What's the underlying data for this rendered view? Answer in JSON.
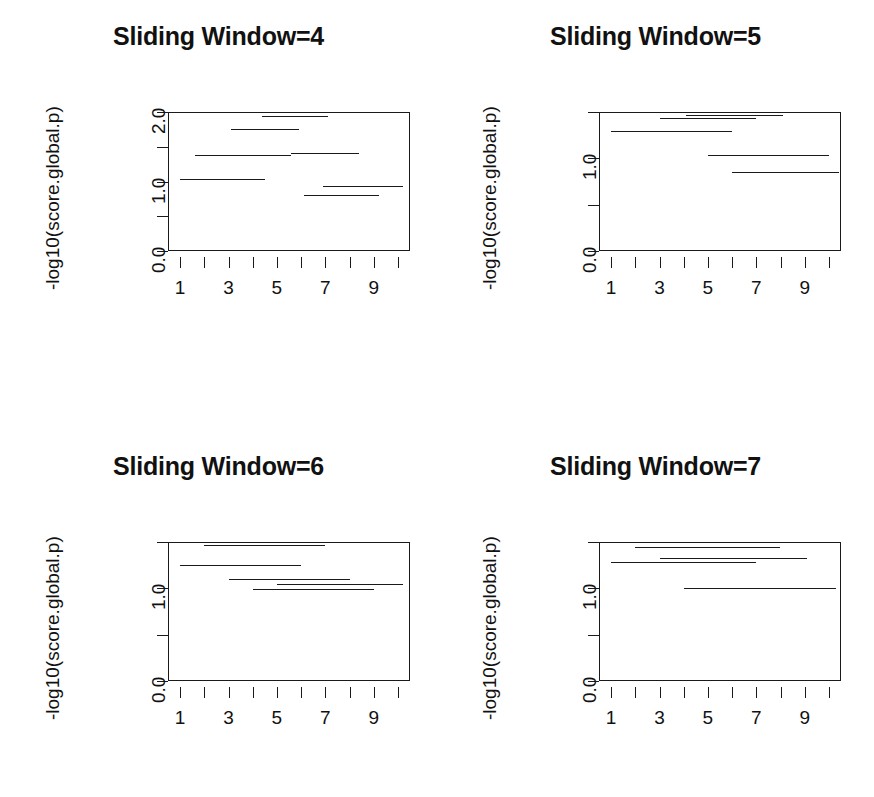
{
  "figure": {
    "layout": "2x2",
    "background": "#ffffff",
    "ink_color": "#1a1a1a"
  },
  "chart_data": [
    {
      "type": "line",
      "title": "Sliding Window=4",
      "xlabel": "",
      "ylabel": "-log10(score.global.p)",
      "xlim": [
        0.5,
        10.5
      ],
      "ylim": [
        0.0,
        2.0
      ],
      "grid": false,
      "legend": "none",
      "xticks": [
        1,
        2,
        3,
        4,
        5,
        6,
        7,
        8,
        9,
        10
      ],
      "xticklabels": [
        "1",
        "",
        "3",
        "",
        "5",
        "",
        "7",
        "",
        "9",
        ""
      ],
      "yticks": [
        0.0,
        0.5,
        1.0,
        1.5,
        2.0
      ],
      "yticklabels": [
        "0.0",
        "",
        "1.0",
        "",
        "2.0"
      ],
      "series_name": "segments",
      "segments": [
        {
          "x_start": 4.4,
          "x_end": 7.1,
          "y": 1.94
        },
        {
          "x_start": 3.1,
          "x_end": 5.9,
          "y": 1.76
        },
        {
          "x_start": 1.6,
          "x_end": 5.6,
          "y": 1.38
        },
        {
          "x_start": 5.6,
          "x_end": 8.4,
          "y": 1.41
        },
        {
          "x_start": 1.0,
          "x_end": 4.5,
          "y": 1.04
        },
        {
          "x_start": 6.9,
          "x_end": 10.2,
          "y": 0.93
        },
        {
          "x_start": 6.1,
          "x_end": 9.2,
          "y": 0.8
        }
      ]
    },
    {
      "type": "line",
      "title": "Sliding Window=5",
      "xlabel": "",
      "ylabel": "-log10(score.global.p)",
      "xlim": [
        0.5,
        10.5
      ],
      "ylim": [
        0.0,
        1.5
      ],
      "grid": false,
      "legend": "none",
      "xticks": [
        1,
        2,
        3,
        4,
        5,
        6,
        7,
        8,
        9,
        10
      ],
      "xticklabels": [
        "1",
        "",
        "3",
        "",
        "5",
        "",
        "7",
        "",
        "9",
        ""
      ],
      "yticks": [
        0.0,
        0.5,
        1.0,
        1.5
      ],
      "yticklabels": [
        "0.0",
        "",
        "1.0",
        ""
      ],
      "series_name": "segments",
      "segments": [
        {
          "x_start": 4.1,
          "x_end": 8.1,
          "y": 1.47
        },
        {
          "x_start": 3.0,
          "x_end": 7.0,
          "y": 1.43
        },
        {
          "x_start": 1.0,
          "x_end": 6.0,
          "y": 1.29
        },
        {
          "x_start": 5.0,
          "x_end": 10.0,
          "y": 1.04
        },
        {
          "x_start": 6.0,
          "x_end": 10.4,
          "y": 0.85
        }
      ]
    },
    {
      "type": "line",
      "title": "Sliding Window=6",
      "xlabel": "",
      "ylabel": "-log10(score.global.p)",
      "xlim": [
        0.5,
        10.5
      ],
      "ylim": [
        0.0,
        1.5
      ],
      "grid": false,
      "legend": "none",
      "xticks": [
        1,
        2,
        3,
        4,
        5,
        6,
        7,
        8,
        9,
        10
      ],
      "xticklabels": [
        "1",
        "",
        "3",
        "",
        "5",
        "",
        "7",
        "",
        "9",
        ""
      ],
      "yticks": [
        0.0,
        0.5,
        1.0,
        1.5
      ],
      "yticklabels": [
        "0.0",
        "",
        "1.0",
        ""
      ],
      "series_name": "segments",
      "segments": [
        {
          "x_start": 2.0,
          "x_end": 7.0,
          "y": 1.47
        },
        {
          "x_start": 1.0,
          "x_end": 6.0,
          "y": 1.25
        },
        {
          "x_start": 3.0,
          "x_end": 8.0,
          "y": 1.1
        },
        {
          "x_start": 5.0,
          "x_end": 10.2,
          "y": 1.05
        },
        {
          "x_start": 4.0,
          "x_end": 9.0,
          "y": 0.99
        }
      ]
    },
    {
      "type": "line",
      "title": "Sliding Window=7",
      "xlabel": "",
      "ylabel": "-log10(score.global.p)",
      "xlim": [
        0.5,
        10.5
      ],
      "ylim": [
        0.0,
        1.5
      ],
      "grid": false,
      "legend": "none",
      "xticks": [
        1,
        2,
        3,
        4,
        5,
        6,
        7,
        8,
        9,
        10
      ],
      "xticklabels": [
        "1",
        "",
        "3",
        "",
        "5",
        "",
        "7",
        "",
        "9",
        ""
      ],
      "yticks": [
        0.0,
        0.5,
        1.0,
        1.5
      ],
      "yticklabels": [
        "0.0",
        "",
        "1.0",
        ""
      ],
      "series_name": "segments",
      "segments": [
        {
          "x_start": 2.0,
          "x_end": 8.0,
          "y": 1.45
        },
        {
          "x_start": 3.0,
          "x_end": 9.1,
          "y": 1.33
        },
        {
          "x_start": 1.0,
          "x_end": 7.0,
          "y": 1.28
        },
        {
          "x_start": 4.0,
          "x_end": 10.3,
          "y": 1.0
        }
      ]
    }
  ]
}
